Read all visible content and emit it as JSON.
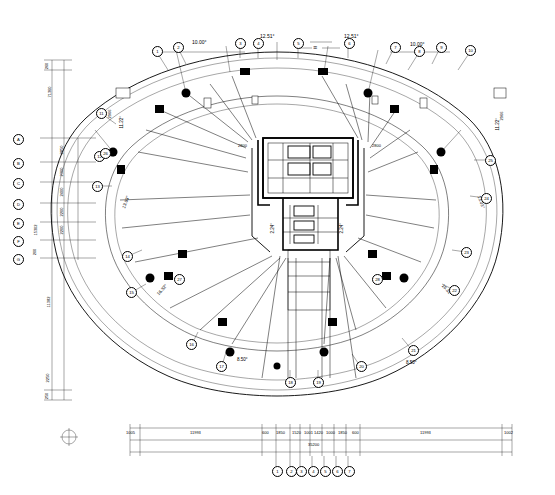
{
  "drawing": {
    "type": "architectural-floor-plan",
    "title": "",
    "north_symbol": "circle-with-cross",
    "units": "mm"
  },
  "top_dimensions": [
    {
      "text": "10.00°",
      "x": 200,
      "y": 45
    },
    {
      "text": "12.51°",
      "x": 268,
      "y": 40
    },
    {
      "text": "12.51°",
      "x": 352,
      "y": 40
    },
    {
      "text": "10.00°",
      "x": 418,
      "y": 47
    }
  ],
  "angle_labels": [
    {
      "text": "13.03°",
      "x": 128,
      "y": 206
    },
    {
      "text": "13.03°",
      "x": 480,
      "y": 206
    },
    {
      "text": "16.32°",
      "x": 163,
      "y": 290
    },
    {
      "text": "16.32°",
      "x": 447,
      "y": 290
    },
    {
      "text": "8.50°",
      "x": 243,
      "y": 360
    },
    {
      "text": "8.50°",
      "x": 412,
      "y": 363
    },
    {
      "text": "11.22°",
      "x": 128,
      "y": 126
    },
    {
      "text": "11.22°",
      "x": 500,
      "y": 128
    },
    {
      "text": "2.24°",
      "x": 276,
      "y": 229
    },
    {
      "text": "2.24°",
      "x": 343,
      "y": 229
    }
  ],
  "inner_labels": [
    {
      "text": "2800",
      "x": 245,
      "y": 148
    },
    {
      "text": "2800",
      "x": 378,
      "y": 148
    },
    {
      "text": "2966",
      "x": 502,
      "y": 120
    },
    {
      "text": "2966",
      "x": 112,
      "y": 118
    }
  ],
  "left_dim_chain": {
    "totals": [
      "71360",
      "15302",
      "11382"
    ],
    "values": [
      "2850",
      "2300",
      "2400",
      "2200",
      "2200",
      "2250"
    ],
    "small": [
      "260",
      "200",
      "250"
    ]
  },
  "bottom_dim_chain": {
    "segments": [
      "11993",
      "600",
      "1850",
      "1520",
      "1001",
      "1420",
      "1000",
      "1850",
      "600",
      "11993"
    ],
    "edge_left": "1005",
    "edge_right": "1002",
    "total": "35200"
  },
  "left_grid_bubbles": [
    "A",
    "B",
    "C",
    "D",
    "E",
    "F",
    "G"
  ],
  "bottom_grid_bubbles": [
    "1",
    "2",
    "3",
    "4",
    "5",
    "6",
    "7"
  ],
  "perimeter_bubbles": [
    "1",
    "2",
    "3",
    "4",
    "5",
    "6",
    "7",
    "8",
    "9",
    "10",
    "11",
    "12",
    "13",
    "14",
    "15",
    "16",
    "17",
    "18",
    "19",
    "20",
    "21",
    "22",
    "23",
    "24",
    "25",
    "26",
    "27",
    "28"
  ],
  "legend_marks": [
    {
      "text": "≡",
      "x": 316,
      "y": 50
    }
  ]
}
